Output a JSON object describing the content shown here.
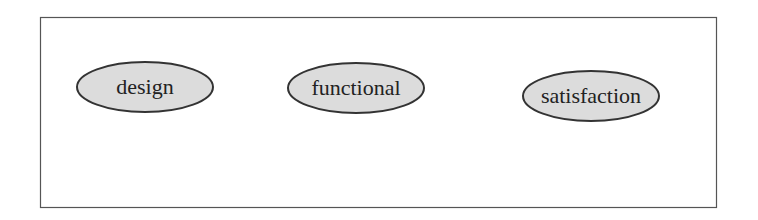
{
  "diagram": {
    "frame": {
      "x": 40,
      "y": 17,
      "width": 676,
      "height": 190,
      "stroke": "#555555"
    },
    "nodes": [
      {
        "id": "design",
        "label": "design",
        "cx": 145,
        "cy": 87,
        "rx": 68,
        "ry": 25
      },
      {
        "id": "functional",
        "label": "functional",
        "cx": 356,
        "cy": 88,
        "rx": 68,
        "ry": 25
      },
      {
        "id": "satisfaction",
        "label": "satisfaction",
        "cx": 591,
        "cy": 96,
        "rx": 68,
        "ry": 25
      }
    ],
    "node_fill": "#dcdcdc",
    "node_stroke": "#333333"
  }
}
